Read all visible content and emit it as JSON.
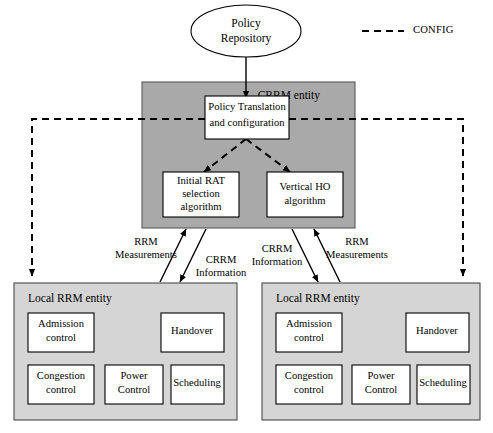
{
  "diagram": {
    "colors": {
      "crrm_fill": "#a9a9a9",
      "local_fill": "#d5d5d5",
      "box_fill": "#ffffff",
      "stroke": "#000000",
      "background": "#ffffff"
    },
    "policy_repository": {
      "label_line1": "Policy",
      "label_line2": "Repository"
    },
    "legend": {
      "label": "CONFIG",
      "style": "dashed"
    },
    "crrm_entity": {
      "label": "CRRM entity",
      "policy_translation": {
        "line1": "Policy Translation",
        "line2": "and configuration"
      },
      "initial_rat": {
        "line1": "Initial RAT",
        "line2": "selection",
        "line3": "algorithm"
      },
      "vertical_ho": {
        "line1": "Vertical HO",
        "line2": "algorithm"
      }
    },
    "flow_labels": {
      "rrm_left_line1": "RRM",
      "rrm_left_line2": "Measurements",
      "crrm_left_line1": "CRRM",
      "crrm_left_line2": "Information",
      "crrm_right_line1": "CRRM",
      "crrm_right_line2": "Information",
      "rrm_right_line1": "RRM",
      "rrm_right_line2": "Measurements"
    },
    "local_rrm_left": {
      "label": "Local RRM entity",
      "blocks": [
        {
          "line1": "Admission",
          "line2": "control"
        },
        {
          "line1": "Handover",
          "line2": ""
        },
        {
          "line1": "Congestion",
          "line2": "control"
        },
        {
          "line1": "Power",
          "line2": "Control"
        },
        {
          "line1": "Scheduling",
          "line2": ""
        }
      ]
    },
    "local_rrm_right": {
      "label": "Local RRM entity",
      "blocks": [
        {
          "line1": "Admission",
          "line2": "control"
        },
        {
          "line1": "Handover",
          "line2": ""
        },
        {
          "line1": "Congestion",
          "line2": "control"
        },
        {
          "line1": "Power",
          "line2": "Control"
        },
        {
          "line1": "Scheduling",
          "line2": ""
        }
      ]
    }
  }
}
